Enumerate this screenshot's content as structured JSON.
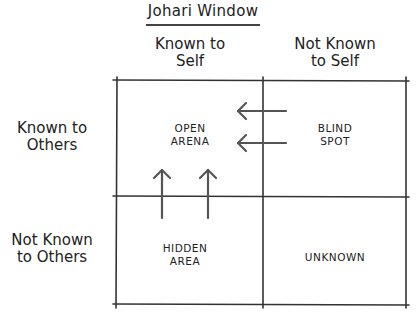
{
  "title": "Johari Window",
  "columns": [
    {
      "label": "Known to\nSelf",
      "line1": "Known to",
      "line2": "Self"
    },
    {
      "label": "Not Known\nto Self",
      "line1": "Not Known",
      "line2": "to Self"
    }
  ],
  "rows": [
    {
      "label": "Known to\nOthers",
      "line1": "Known to",
      "line2": "Others"
    },
    {
      "label": "Not Known\nto Others",
      "line1": "Not Known",
      "line2": "to Others"
    }
  ],
  "quadrants": {
    "open": {
      "line1": "OPEN",
      "line2": "ARENA"
    },
    "blind": {
      "line1": "BLIND",
      "line2": "SPOT"
    },
    "hidden": {
      "line1": "HIDDEN",
      "line2": "AREA"
    },
    "unknown": {
      "line1": "UNKNOWN"
    }
  },
  "arrows": [
    {
      "direction": "left",
      "from": "blind",
      "to": "open"
    },
    {
      "direction": "left",
      "from": "blind",
      "to": "open"
    },
    {
      "direction": "up",
      "from": "hidden",
      "to": "open"
    },
    {
      "direction": "up",
      "from": "hidden",
      "to": "open"
    }
  ],
  "colors": {
    "line": "#333333",
    "arrow": "#555555",
    "text": "#222222"
  }
}
